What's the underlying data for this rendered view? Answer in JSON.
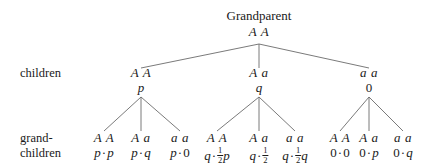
{
  "diagram": {
    "type": "inheritance-tree",
    "title": "Grandparent",
    "root": {
      "label": "Grandparent",
      "genotype": "A A"
    },
    "row_labels": {
      "children": "children",
      "grandchildren_line1": "grand-",
      "grandchildren_line2": "children"
    },
    "children": [
      {
        "genotype": "A A",
        "frequency": "p"
      },
      {
        "genotype": "A a",
        "frequency": "q"
      },
      {
        "genotype": "a a",
        "frequency": "0"
      }
    ],
    "grandchildren": [
      {
        "genotype": "A A",
        "formula_left": "p",
        "formula_right": "p",
        "fraction": null
      },
      {
        "genotype": "A a",
        "formula_left": "p",
        "formula_right": "q",
        "fraction": null
      },
      {
        "genotype": "a a",
        "formula_left": "p",
        "formula_right": "0",
        "fraction": null
      },
      {
        "genotype": "A A",
        "formula_left": "q",
        "formula_right": "p",
        "fraction": "1/2"
      },
      {
        "genotype": "A a",
        "formula_left": "q",
        "formula_right": "",
        "fraction": "1/2"
      },
      {
        "genotype": "a a",
        "formula_left": "q",
        "formula_right": "q",
        "fraction": "1/2"
      },
      {
        "genotype": "A A",
        "formula_left": "0",
        "formula_right": "0",
        "fraction": null
      },
      {
        "genotype": "A a",
        "formula_left": "0",
        "formula_right": "p",
        "fraction": null
      },
      {
        "genotype": "a a",
        "formula_left": "0",
        "formula_right": "q",
        "fraction": null
      }
    ],
    "operator": "·",
    "fraction_numerator": "1",
    "fraction_denominator": "2",
    "colors": {
      "background": "#ffffff",
      "text": "#1a1a1a",
      "edge": "#6b6b6b"
    }
  }
}
